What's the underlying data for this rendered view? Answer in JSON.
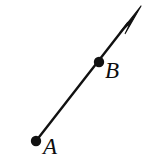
{
  "figure": {
    "type": "geometry-ray-diagram",
    "background_color": "#ffffff",
    "stroke_color": "#111111",
    "canvas": {
      "width": 149,
      "height": 156
    },
    "labels": {
      "a": "A",
      "b": "B"
    },
    "points": [
      {
        "name": "A",
        "label": "A",
        "x": 36,
        "y": 141,
        "dot_radius": 5.2
      },
      {
        "name": "B",
        "label": "B",
        "x": 99,
        "y": 62,
        "dot_radius": 5.2
      }
    ],
    "ray": {
      "start_x": 36,
      "start_y": 141,
      "end_x": 139,
      "end_y": 9,
      "stroke_width": 2.4,
      "arrow_tip_x": 141,
      "arrow_tip_y": 6
    },
    "arrowhead": {
      "name": "arrowhead",
      "tip_x": 141,
      "tip_y": 6,
      "length": 30,
      "half_width": 7
    }
  }
}
